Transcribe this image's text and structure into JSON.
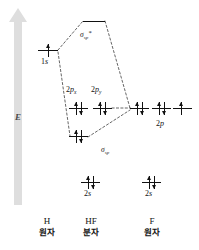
{
  "figure": {
    "type": "molecular-orbital-energy-diagram",
    "molecule": "HF",
    "background": "#ffffff",
    "ink": "#111111"
  },
  "axis": {
    "label": "E",
    "meaning": "energy-increasing-upward",
    "arrow_color": "#dedede",
    "direction": "up"
  },
  "columns": [
    {
      "id": "h",
      "symbol": "H",
      "caption": "원자",
      "center_x": 47
    },
    {
      "id": "hf",
      "symbol": "HF",
      "caption": "분자",
      "center_x": 91
    },
    {
      "id": "f",
      "symbol": "F",
      "caption": "원자",
      "center_x": 152
    }
  ],
  "levels": [
    {
      "id": "sigma-sp-star",
      "column": "hf",
      "label": "σ",
      "label_sub": "sp",
      "label_sup": "*",
      "label_text": "σsp*",
      "x": 83,
      "y": 21,
      "width": 22,
      "electrons": [],
      "electron_count": 0,
      "occupied": false
    },
    {
      "id": "h-1s",
      "column": "h",
      "label_text": "1s",
      "x": 38,
      "y": 50,
      "width": 20,
      "electrons": [
        "up"
      ],
      "electron_count": 1,
      "occupied": true
    },
    {
      "id": "hf-2px",
      "column": "hf",
      "label_text": "2px",
      "label": "2p",
      "label_sub": "x",
      "x": 69,
      "y": 108,
      "width": 19,
      "electrons": [
        "up",
        "down"
      ],
      "electron_count": 2,
      "occupied": true
    },
    {
      "id": "hf-2py",
      "column": "hf",
      "label_text": "2py",
      "label": "2p",
      "label_sub": "y",
      "x": 93,
      "y": 108,
      "width": 19,
      "electrons": [
        "up",
        "down"
      ],
      "electron_count": 2,
      "occupied": true
    },
    {
      "id": "f-2p-a",
      "column": "f",
      "x": 130,
      "y": 108,
      "width": 19,
      "electrons": [
        "up",
        "down"
      ],
      "electron_count": 2,
      "occupied": true
    },
    {
      "id": "f-2p-b",
      "column": "f",
      "x": 152,
      "y": 108,
      "width": 19,
      "electrons": [
        "up",
        "down"
      ],
      "electron_count": 2,
      "occupied": true
    },
    {
      "id": "f-2p-c",
      "column": "f",
      "x": 173,
      "y": 108,
      "width": 19,
      "electrons": [
        "up"
      ],
      "electron_count": 1,
      "occupied": true
    },
    {
      "id": "sigma-sp",
      "column": "hf",
      "label": "σ",
      "label_sub": "sp",
      "label_text": "σsp",
      "x": 69,
      "y": 136,
      "width": 19,
      "electrons": [
        "up",
        "down"
      ],
      "electron_count": 2,
      "occupied": true
    },
    {
      "id": "hf-2s",
      "column": "hf",
      "label_text": "2s",
      "x": 81,
      "y": 182,
      "width": 19,
      "electrons": [
        "up",
        "down"
      ],
      "electron_count": 2,
      "occupied": true
    },
    {
      "id": "f-2s",
      "column": "f",
      "label_text": "2s",
      "x": 142,
      "y": 182,
      "width": 19,
      "electrons": [
        "up",
        "down"
      ],
      "electron_count": 2,
      "occupied": true
    }
  ],
  "level_labels": {
    "sigma_star": {
      "base": "σ",
      "sub": "sp",
      "sup": "*"
    },
    "sigma_bond": {
      "base": "σ",
      "sub": "sp",
      "sup": ""
    },
    "h_1s": {
      "num": "1",
      "orb": "s"
    },
    "p_x": {
      "num": "2",
      "orb": "p",
      "sub": "x"
    },
    "p_y": {
      "num": "2",
      "orb": "p",
      "sub": "y"
    },
    "f_2p": {
      "num": "2",
      "orb": "p"
    },
    "hf_2s": {
      "num": "2",
      "orb": "s"
    },
    "f_2s": {
      "num": "2",
      "orb": "s"
    }
  },
  "correlation_lines": {
    "style": "dashed",
    "color": "#222222",
    "description": "dashed lines connecting H 1s and F 2p to the HF sigma bonding and antibonding levels"
  }
}
